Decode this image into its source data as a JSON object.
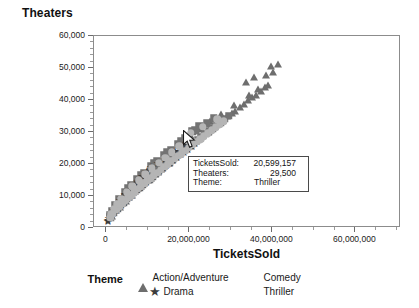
{
  "chart_data": {
    "type": "scatter",
    "title": "Theaters",
    "xlabel": "TicketsSold",
    "ylabel": "Theaters",
    "xlim": [
      -3000000,
      71000000
    ],
    "ylim": [
      0,
      60000
    ],
    "grid": false,
    "legend_title": "Theme",
    "legend_position": "bottom",
    "xticks": [
      0,
      20000000,
      40000000,
      60000000
    ],
    "xticklabels": [
      "0",
      "20,000,000",
      "40,000,000",
      "60,000,000"
    ],
    "yticks": [
      0,
      10000,
      20000,
      30000,
      40000,
      50000,
      60000
    ],
    "yticklabels": [
      "0",
      "10,000",
      "20,000",
      "30,000",
      "40,000",
      "50,000",
      "60,000"
    ],
    "series": [
      {
        "name": "Action/Adventure",
        "marker": "triangle",
        "color": "#6e6e6e",
        "points": [
          [
            1500000,
            3400
          ],
          [
            2600000,
            5200
          ],
          [
            3400000,
            6100
          ],
          [
            4100000,
            7400
          ],
          [
            4900000,
            8200
          ],
          [
            5600000,
            9300
          ],
          [
            6400000,
            10100
          ],
          [
            7100000,
            11200
          ],
          [
            7900000,
            12300
          ],
          [
            8600000,
            12900
          ],
          [
            9400000,
            13800
          ],
          [
            10200000,
            14600
          ],
          [
            11000000,
            15400
          ],
          [
            11900000,
            16500
          ],
          [
            12600000,
            17300
          ],
          [
            13400000,
            18200
          ],
          [
            14200000,
            19000
          ],
          [
            15100000,
            20100
          ],
          [
            15900000,
            21000
          ],
          [
            16700000,
            21800
          ],
          [
            17600000,
            22700
          ],
          [
            18400000,
            23600
          ],
          [
            19300000,
            24500
          ],
          [
            20100000,
            25200
          ],
          [
            21000000,
            26100
          ],
          [
            21900000,
            27000
          ],
          [
            22800000,
            27900
          ],
          [
            23600000,
            28700
          ],
          [
            24600000,
            29800
          ],
          [
            25500000,
            30600
          ],
          [
            26400000,
            31500
          ],
          [
            27400000,
            32600
          ],
          [
            28300000,
            33400
          ],
          [
            29400000,
            34600
          ],
          [
            30400000,
            35600
          ],
          [
            31300000,
            36400
          ],
          [
            32400000,
            37600
          ],
          [
            33300000,
            38400
          ],
          [
            34400000,
            39600
          ],
          [
            35400000,
            40600
          ],
          [
            36300000,
            41400
          ],
          [
            37400000,
            42600
          ],
          [
            38400000,
            43600
          ],
          [
            39200000,
            44400
          ],
          [
            33800000,
            45200
          ],
          [
            35900000,
            46800
          ],
          [
            38600000,
            47600
          ],
          [
            40300000,
            48400
          ],
          [
            36800000,
            43000
          ],
          [
            39900000,
            50200
          ],
          [
            41600000,
            50800
          ],
          [
            34600000,
            41200
          ],
          [
            30900000,
            38200
          ],
          [
            27900000,
            35400
          ],
          [
            25100000,
            33100
          ],
          [
            23100000,
            30700
          ],
          [
            20600000,
            28400
          ],
          [
            18900000,
            26500
          ],
          [
            16200000,
            24000
          ],
          [
            13900000,
            21600
          ],
          [
            11600000,
            19100
          ],
          [
            9900000,
            17200
          ],
          [
            8200000,
            15300
          ],
          [
            6900000,
            13600
          ],
          [
            5200000,
            11300
          ],
          [
            3900000,
            9100
          ],
          [
            2900000,
            7300
          ],
          [
            2100000,
            5600
          ]
        ]
      },
      {
        "name": "Comedy",
        "marker": "square",
        "color": "#737373",
        "points": [
          [
            1200000,
            3000
          ],
          [
            2000000,
            4600
          ],
          [
            2800000,
            5800
          ],
          [
            3600000,
            6900
          ],
          [
            4300000,
            7800
          ],
          [
            5100000,
            8900
          ],
          [
            5800000,
            9800
          ],
          [
            6600000,
            10700
          ],
          [
            7400000,
            11600
          ],
          [
            8100000,
            12400
          ],
          [
            8900000,
            13300
          ],
          [
            9700000,
            14200
          ],
          [
            10500000,
            15000
          ],
          [
            11300000,
            15900
          ],
          [
            12100000,
            16800
          ],
          [
            12900000,
            17700
          ],
          [
            13700000,
            18500
          ],
          [
            14500000,
            19400
          ],
          [
            15400000,
            20300
          ],
          [
            16200000,
            21200
          ],
          [
            17000000,
            22000
          ],
          [
            17900000,
            22900
          ],
          [
            18700000,
            23800
          ],
          [
            19600000,
            24700
          ],
          [
            20400000,
            25500
          ],
          [
            21300000,
            26400
          ],
          [
            22200000,
            27300
          ],
          [
            23000000,
            28100
          ],
          [
            24000000,
            29100
          ],
          [
            24900000,
            30000
          ],
          [
            25800000,
            30900
          ],
          [
            26800000,
            31900
          ],
          [
            27700000,
            32800
          ],
          [
            28700000,
            33800
          ],
          [
            29700000,
            34700
          ],
          [
            22600000,
            31600
          ],
          [
            20900000,
            29900
          ],
          [
            19100000,
            27800
          ],
          [
            17400000,
            25900
          ],
          [
            15700000,
            24100
          ],
          [
            14100000,
            22400
          ],
          [
            12400000,
            20600
          ],
          [
            10900000,
            19000
          ],
          [
            9200000,
            17000
          ],
          [
            7700000,
            15000
          ],
          [
            6200000,
            13200
          ],
          [
            4700000,
            11000
          ],
          [
            3300000,
            8800
          ],
          [
            2400000,
            6900
          ],
          [
            1700000,
            5100
          ],
          [
            1000000,
            3600
          ],
          [
            5500000,
            12100
          ],
          [
            8500000,
            16300
          ],
          [
            11800000,
            20000
          ],
          [
            14900000,
            23300
          ],
          [
            18200000,
            26900
          ],
          [
            21700000,
            30300
          ],
          [
            24400000,
            32400
          ],
          [
            26100000,
            34000
          ]
        ]
      },
      {
        "name": "Drama",
        "marker": "star",
        "color": "#3c3c3c",
        "points": [
          [
            700000,
            2100
          ],
          [
            1300000,
            3300
          ],
          [
            1900000,
            4300
          ],
          [
            2500000,
            5200
          ],
          [
            3100000,
            6000
          ],
          [
            3700000,
            6800
          ],
          [
            4400000,
            7700
          ],
          [
            5000000,
            8500
          ],
          [
            5700000,
            9400
          ],
          [
            6300000,
            10100
          ],
          [
            7000000,
            10900
          ],
          [
            7700000,
            11800
          ],
          [
            8400000,
            12600
          ],
          [
            9100000,
            13400
          ],
          [
            9800000,
            14200
          ],
          [
            10600000,
            15100
          ],
          [
            11400000,
            16000
          ],
          [
            12200000,
            16800
          ],
          [
            13000000,
            17600
          ],
          [
            13800000,
            18400
          ],
          [
            14700000,
            19300
          ],
          [
            15500000,
            20100
          ],
          [
            16400000,
            21000
          ],
          [
            17300000,
            21900
          ],
          [
            18100000,
            22700
          ],
          [
            19000000,
            23500
          ],
          [
            19900000,
            24400
          ],
          [
            20800000,
            25300
          ],
          [
            21700000,
            26100
          ],
          [
            12700000,
            19900
          ],
          [
            10100000,
            17600
          ],
          [
            8800000,
            15800
          ],
          [
            7200000,
            13900
          ],
          [
            5900000,
            12000
          ],
          [
            4600000,
            10200
          ],
          [
            3500000,
            8300
          ],
          [
            2700000,
            6600
          ],
          [
            2000000,
            5400
          ],
          [
            1500000,
            4100
          ],
          [
            900000,
            2700
          ],
          [
            600000,
            1800
          ],
          [
            14300000,
            21400
          ],
          [
            16800000,
            23800
          ],
          [
            18600000,
            25600
          ],
          [
            11100000,
            18600
          ],
          [
            6700000,
            12800
          ],
          [
            4000000,
            9500
          ]
        ]
      },
      {
        "name": "Thriller",
        "marker": "circle",
        "color": "#b5b5b5",
        "points": [
          [
            1100000,
            2900
          ],
          [
            1800000,
            4200
          ],
          [
            2600000,
            5500
          ],
          [
            3300000,
            6400
          ],
          [
            4000000,
            7300
          ],
          [
            4800000,
            8300
          ],
          [
            5500000,
            9200
          ],
          [
            6200000,
            10000
          ],
          [
            7000000,
            10900
          ],
          [
            7800000,
            11900
          ],
          [
            8500000,
            12700
          ],
          [
            9300000,
            13600
          ],
          [
            10100000,
            14400
          ],
          [
            10900000,
            15300
          ],
          [
            11700000,
            16200
          ],
          [
            12500000,
            17000
          ],
          [
            13300000,
            17900
          ],
          [
            14200000,
            18800
          ],
          [
            15000000,
            19600
          ],
          [
            15800000,
            20500
          ],
          [
            16700000,
            21400
          ],
          [
            17500000,
            22200
          ],
          [
            18400000,
            23100
          ],
          [
            19200000,
            23900
          ],
          [
            20100000,
            24800
          ],
          [
            20599157,
            29500
          ],
          [
            21000000,
            25700
          ],
          [
            21900000,
            26600
          ],
          [
            22800000,
            27400
          ],
          [
            23700000,
            28300
          ],
          [
            24700000,
            29300
          ],
          [
            25600000,
            30200
          ],
          [
            26600000,
            31200
          ],
          [
            27500000,
            32000
          ],
          [
            28500000,
            33000
          ],
          [
            23400000,
            31400
          ],
          [
            26900000,
            33700
          ],
          [
            19700000,
            27100
          ],
          [
            17800000,
            25200
          ],
          [
            16000000,
            23400
          ],
          [
            14400000,
            21700
          ],
          [
            12800000,
            20100
          ],
          [
            11200000,
            18400
          ],
          [
            9600000,
            16500
          ],
          [
            8000000,
            14600
          ],
          [
            6500000,
            12700
          ],
          [
            5100000,
            10800
          ],
          [
            3800000,
            8900
          ],
          [
            2800000,
            7100
          ],
          [
            2100000,
            5700
          ],
          [
            1400000,
            4000
          ]
        ]
      }
    ],
    "tooltip": {
      "visible": true,
      "rows": [
        {
          "label": "TicketsSold:",
          "value": "20,599,157"
        },
        {
          "label": "Theaters:",
          "value": "29,500"
        },
        {
          "label": "Theme:",
          "value": "Thriller"
        }
      ]
    }
  }
}
